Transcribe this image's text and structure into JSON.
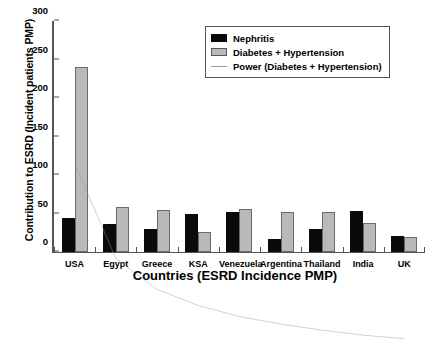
{
  "chart_data": {
    "type": "bar",
    "title": "",
    "xlabel": "Countries (ESRD Incidence PMP)",
    "ylabel": "Contribution to ESRD (Incident patients PMP)",
    "categories": [
      "USA",
      "Egypt",
      "Greece",
      "KSA",
      "Venezuela",
      "Argentina",
      "Thailand",
      "India",
      "UK"
    ],
    "series": [
      {
        "name": "Nephritis",
        "color": "#0a0a0a",
        "values": [
          44,
          36,
          30,
          49,
          52,
          17,
          30,
          53,
          21
        ]
      },
      {
        "name": "Diabetes + Hypertension",
        "color": "#b9b9b9",
        "values": [
          240,
          59,
          54,
          26,
          56,
          52,
          52,
          38,
          20
        ]
      }
    ],
    "trendline": {
      "name": "Power (Diabetes + Hypertension)",
      "color": "#9a9a9a",
      "values": [
        185,
        108,
        83,
        70,
        61,
        55,
        50,
        46,
        43
      ]
    },
    "ylim": [
      0,
      300
    ],
    "yticks": [
      0,
      50,
      100,
      150,
      200,
      250,
      300
    ],
    "grid": false,
    "legend_position": "top-right",
    "legend_entries": [
      "Nephritis",
      "Diabetes + Hypertension",
      "Power (Diabetes + Hypertension)"
    ]
  }
}
